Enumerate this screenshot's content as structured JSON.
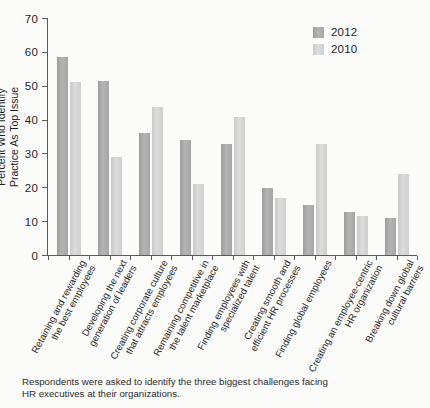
{
  "chart_data": {
    "type": "bar",
    "title": "",
    "xlabel": "",
    "ylabel": "Percent Who Identify Practice As Top Issue",
    "ylabel_lines": [
      "Percent Who Identify",
      "Practice As Top Issue"
    ],
    "ylim": [
      0,
      70
    ],
    "yticks": [
      0,
      10,
      20,
      30,
      40,
      50,
      60,
      70
    ],
    "grid": false,
    "legend_position": "top-right",
    "categories": [
      "Retaining and rewarding the best employees",
      "Developing the next generation of leaders",
      "Creating corporate culture that attracts employees",
      "Remaining competitive in the talent marketplace",
      "Finding employees with specialized talent",
      "Creating smooth and efficient HR processes",
      "Finding global employees",
      "Creating an employee-centric HR organization",
      "Breaking down global cultural barriers"
    ],
    "category_lines": [
      [
        "Retaining and rewarding",
        "the best employees"
      ],
      [
        "Developing the next",
        "generation of leaders"
      ],
      [
        "Creating corporate culture",
        "that attracts employees"
      ],
      [
        "Remaining competitive in",
        "the talent marketplace"
      ],
      [
        "Finding employees with",
        "specialized talent"
      ],
      [
        "Creating smooth and",
        "efficient HR processes"
      ],
      [
        "Finding global employees"
      ],
      [
        "Creating an employee-centric",
        "HR organization"
      ],
      [
        "Breaking down global",
        "cultural barriers"
      ]
    ],
    "series": [
      {
        "name": "2012",
        "color": "#a8a8a8",
        "values": [
          58.5,
          51.5,
          36.0,
          34.0,
          32.7,
          19.8,
          14.7,
          12.7,
          10.8
        ]
      },
      {
        "name": "2010",
        "color": "#d2d2d2",
        "values": [
          51.0,
          29.0,
          43.7,
          21.0,
          40.7,
          16.8,
          32.7,
          11.6,
          23.8
        ]
      }
    ]
  },
  "footnote": {
    "lines": [
      "Respondents were asked to identify the three biggest challenges facing",
      "HR executives at their organizations."
    ]
  }
}
